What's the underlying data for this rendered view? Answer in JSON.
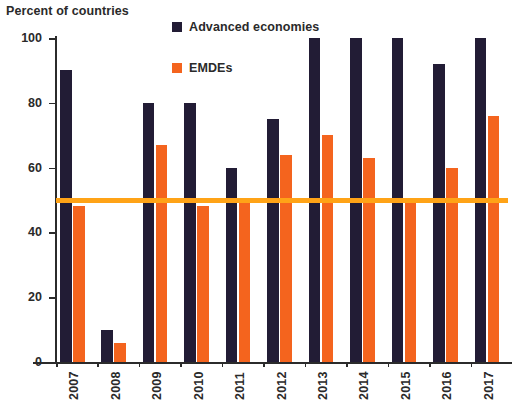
{
  "chart_data": {
    "type": "bar",
    "title": "",
    "ylabel": "Percent of countries",
    "xlabel": "",
    "ylim": [
      0,
      100
    ],
    "yticks": [
      0,
      20,
      40,
      60,
      80,
      100
    ],
    "grid": false,
    "legend_position": "top-center",
    "categories": [
      "2007",
      "2008",
      "2009",
      "2010",
      "2011",
      "2012",
      "2013",
      "2014",
      "2015",
      "2016",
      "2017"
    ],
    "series": [
      {
        "name": "Advanced economies",
        "color": "#221c35",
        "values": [
          90,
          10,
          80,
          80,
          60,
          75,
          100,
          100,
          100,
          92,
          100
        ]
      },
      {
        "name": "EMDEs",
        "color": "#f4641e",
        "values": [
          48,
          6,
          67,
          48,
          50,
          64,
          70,
          63,
          50,
          60,
          76
        ]
      }
    ],
    "reference_line": {
      "name": "50 percent reference line",
      "value": 50,
      "color": "#ffa317"
    }
  },
  "axis": {
    "y_title": "Percent of countries"
  },
  "legend": {
    "items": [
      {
        "label": "Advanced economies",
        "color": "#221c35",
        "icon": "square-marker-icon"
      },
      {
        "label": "EMDEs",
        "color": "#f4641e",
        "icon": "square-marker-icon"
      }
    ]
  }
}
